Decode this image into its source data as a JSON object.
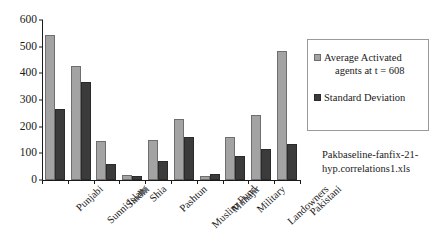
{
  "chart_data": {
    "type": "bar",
    "title": "",
    "xlabel": "",
    "ylabel": "",
    "ylim": [
      0,
      600
    ],
    "yticks": [
      0,
      100,
      200,
      300,
      400,
      500,
      600
    ],
    "grid": false,
    "legend_position": "right",
    "categories": [
      "Punjabi",
      "Sunni Islam",
      "Sindhi",
      "Shia",
      "Pashtun",
      "Muslim Fund",
      "Muhajir",
      "Military",
      "Landowners",
      "Pakistani"
    ],
    "series": [
      {
        "name": "Average Activated agents at t = 608",
        "color": "#a3a3a3",
        "values": [
          545,
          428,
          147,
          18,
          149,
          227,
          15,
          160,
          243,
          485
        ]
      },
      {
        "name": "Standard Deviation",
        "color": "#3b3b3b",
        "values": [
          268,
          369,
          59,
          14,
          72,
          163,
          23,
          90,
          117,
          134
        ]
      }
    ],
    "annotations": [
      "Pakbaseline-fanfix-21-",
      "hyp.correlations1.xls"
    ]
  },
  "legend": {
    "entries": [
      {
        "line1": "Average Activated",
        "line2": "agents at t = 608"
      },
      {
        "line1": "Standard Deviation",
        "line2": ""
      }
    ]
  }
}
